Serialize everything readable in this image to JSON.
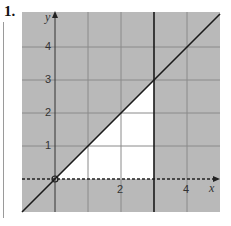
{
  "problem": {
    "number_label": "1."
  },
  "colors": {
    "shaded": "#b9b9b9",
    "unshaded": "#ffffff",
    "grid": "#8a8a8a",
    "line": "#1a1a1a",
    "axis": "#222222"
  },
  "axes": {
    "x_label": "x",
    "y_label": "y",
    "x_ticks": [
      {
        "value": 2,
        "label": "2"
      },
      {
        "value": 4,
        "label": "4"
      }
    ],
    "y_ticks": [
      {
        "value": 1,
        "label": "1"
      },
      {
        "value": 2,
        "label": "2"
      },
      {
        "value": 3,
        "label": "3"
      },
      {
        "value": 4,
        "label": "4"
      }
    ],
    "x_range": [
      -1,
      5
    ],
    "y_range": [
      -1,
      5
    ]
  },
  "boundaries": [
    {
      "name": "y = x",
      "style": "solid"
    },
    {
      "name": "x = 3",
      "style": "solid"
    },
    {
      "name": "y = 0",
      "style": "dashed"
    }
  ],
  "open_point": {
    "x": 0,
    "y": 0
  },
  "feasible_region": {
    "vertices": [
      [
        0,
        0
      ],
      [
        3,
        0
      ],
      [
        3,
        3
      ]
    ],
    "description": "unshaded triangle bounded by y=x, x=3, y>0"
  }
}
